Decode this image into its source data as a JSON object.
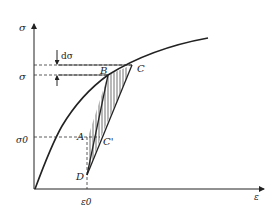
{
  "diagram": {
    "type": "stress-strain curve with unloading-reloading hysteresis",
    "axes": {
      "y_label": "σ",
      "x_label": "ε"
    },
    "ticks": {
      "sigma": "σ",
      "sigma0": "σ0",
      "epsilon0": "ε0",
      "d_sigma": "dσ"
    },
    "points": {
      "A": "A",
      "B": "B",
      "C": "C",
      "C_prime": "C'",
      "D": "D"
    },
    "colors": {
      "line": "#222222",
      "background": "#ffffff"
    }
  }
}
